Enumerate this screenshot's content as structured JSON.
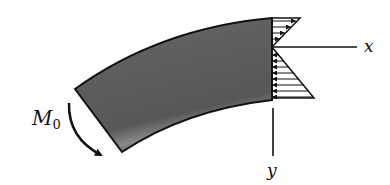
{
  "figure": {
    "type": "curved-beam-bending-stress-diagram",
    "labels": {
      "moment": "M",
      "moment_subscript": "0",
      "x_axis": "x",
      "y_axis": "y"
    },
    "colors": {
      "beam_fill": "#5e5e5e",
      "beam_highlight": "#9a9a9a",
      "outline": "#111111",
      "background": "#ffffff"
    },
    "elements": [
      "curved beam segment",
      "applied moment M0 arrow (clockwise, left end)",
      "linear bending stress distribution (triangular) at right end",
      "x axis (horizontal, through neutral axis)",
      "y axis (vertical, downward)"
    ]
  }
}
